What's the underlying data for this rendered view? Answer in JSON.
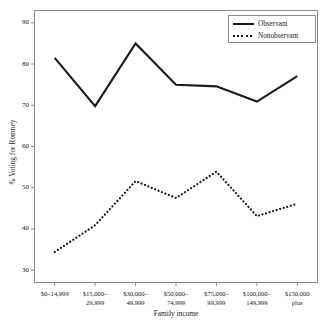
{
  "chart_data": {
    "type": "line",
    "title": "",
    "xlabel": "Family income",
    "ylabel": "% Voting for Romney",
    "categories": [
      "$0–14,999",
      "$15,000–\n29,999",
      "$30,000–\n49,999",
      "$50,000–\n74,999",
      "$75,000–\n99,999",
      "$100,000–\n149,999",
      "$150,000\nplus"
    ],
    "category_lines": [
      [
        "$0–14,999",
        ""
      ],
      [
        "$15,000–",
        "29,999"
      ],
      [
        "$30,000–",
        "49,999"
      ],
      [
        "$50,000–",
        "74,999"
      ],
      [
        "$75,000–",
        "99,999"
      ],
      [
        "$100,000–",
        "149,999"
      ],
      [
        "$150,000",
        "plus"
      ]
    ],
    "series": [
      {
        "name": "Observant",
        "style": "solid",
        "color": "#1a1a1a",
        "values": [
          81.5,
          69.8,
          85.0,
          75.0,
          74.6,
          70.9,
          77.1
        ]
      },
      {
        "name": "Nonobservant",
        "style": "dotted",
        "color": "#1a1a1a",
        "values": [
          34.4,
          40.9,
          51.6,
          47.5,
          53.9,
          43.1,
          46.1
        ]
      }
    ],
    "ylim": [
      27,
      93
    ],
    "yticks": [
      30,
      40,
      50,
      60,
      70,
      80,
      90
    ],
    "ytick_labels": [
      "30",
      "40",
      "50",
      "60",
      "70",
      "80",
      "90"
    ],
    "grid": false,
    "legend_position": "top-right",
    "frame": true
  },
  "legend": {
    "entries": [
      {
        "label": "Observant",
        "style": "solid"
      },
      {
        "label": "Nonobservant",
        "style": "dotted"
      }
    ]
  }
}
